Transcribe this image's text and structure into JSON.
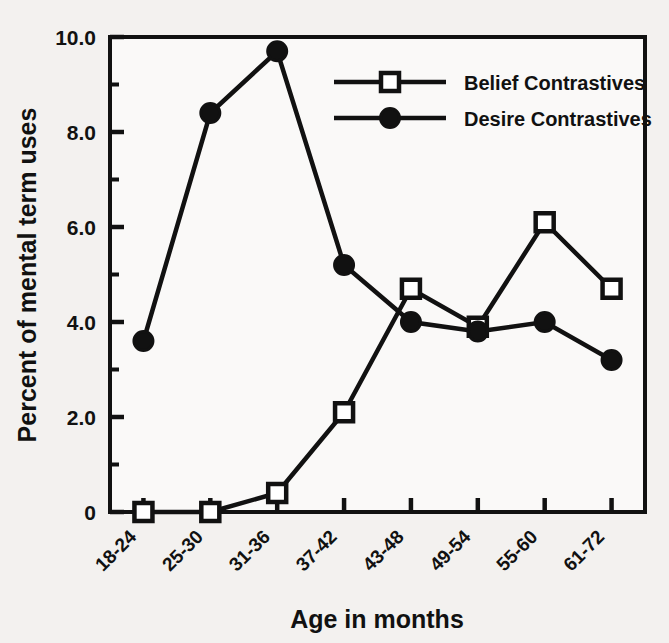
{
  "chart_data": {
    "type": "line",
    "title": "",
    "xlabel": "Age in months",
    "ylabel": "Percent of mental term uses",
    "categories": [
      "18-24",
      "25-30",
      "31-36",
      "37-42",
      "43-48",
      "49-54",
      "55-60",
      "61-72"
    ],
    "series": [
      {
        "name": "Belief Contrastives",
        "marker": "open-square",
        "values": [
          0.0,
          0.0,
          0.4,
          2.1,
          4.7,
          3.9,
          6.1,
          4.7
        ]
      },
      {
        "name": "Desire Contrastives",
        "marker": "filled-circle",
        "values": [
          3.6,
          8.4,
          9.7,
          5.2,
          4.0,
          3.8,
          4.0,
          3.2
        ]
      }
    ],
    "ylim": [
      0,
      10
    ],
    "ytick_labels": [
      "0",
      "2.0",
      "4.0",
      "6.0",
      "8.0",
      "10.0"
    ],
    "ytick_values": [
      0,
      2.0,
      4.0,
      6.0,
      8.0,
      10.0
    ],
    "yminor_values": [
      1.0,
      3.0,
      5.0,
      7.0,
      9.0
    ],
    "grid": false,
    "legend_position": "top-right-inside",
    "colors": {
      "line": "#111111",
      "marker_fill": "#ffffff",
      "background": "#f3f1ef",
      "axis": "#111111"
    }
  },
  "legend": {
    "entries": [
      {
        "label": "Belief Contrastives",
        "marker": "open-square"
      },
      {
        "label": "Desire Contrastives",
        "marker": "filled-circle"
      }
    ]
  }
}
